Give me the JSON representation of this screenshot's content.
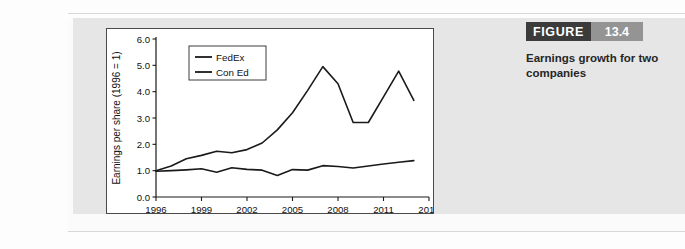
{
  "figure": {
    "word_label": "FIGURE",
    "number_label": "13.4",
    "description": "Earnings growth for two companies",
    "word_bg": "#3b3b3b",
    "number_bg": "#949494"
  },
  "chart_data": {
    "type": "line",
    "title": "",
    "xlabel": "",
    "ylabel": "Earnings per share (1996 = 1)",
    "xlim": [
      1996,
      2014
    ],
    "ylim": [
      0.0,
      6.0
    ],
    "grid": false,
    "legend_position": "top-left",
    "x_ticks": [
      "1996",
      "1999",
      "2002",
      "2005",
      "2008",
      "2011",
      "2014"
    ],
    "x_tick_values": [
      1996,
      1999,
      2002,
      2005,
      2008,
      2011,
      2014
    ],
    "y_ticks": [
      "0.0",
      "1.0",
      "2.0",
      "3.0",
      "4.0",
      "5.0",
      "6.0"
    ],
    "y_tick_values": [
      0.0,
      1.0,
      2.0,
      3.0,
      4.0,
      5.0,
      6.0
    ],
    "x": [
      1996,
      1997,
      1998,
      1999,
      2000,
      2001,
      2002,
      2003,
      2004,
      2005,
      2006,
      2007,
      2008,
      2009,
      2010,
      2011,
      2012,
      2013
    ],
    "series": [
      {
        "name": "FedEx",
        "color": "#1a1a1a",
        "values": [
          1.0,
          1.18,
          1.45,
          1.58,
          1.74,
          1.68,
          1.8,
          2.05,
          2.55,
          3.2,
          4.05,
          4.95,
          4.3,
          2.83,
          2.83,
          3.8,
          4.78,
          3.67
        ]
      },
      {
        "name": "Con Ed",
        "color": "#1a1a1a",
        "values": [
          0.98,
          1.0,
          1.03,
          1.07,
          0.94,
          1.11,
          1.05,
          1.02,
          0.82,
          1.04,
          1.02,
          1.19,
          1.16,
          1.1,
          1.18,
          1.25,
          1.32,
          1.38
        ]
      }
    ]
  }
}
